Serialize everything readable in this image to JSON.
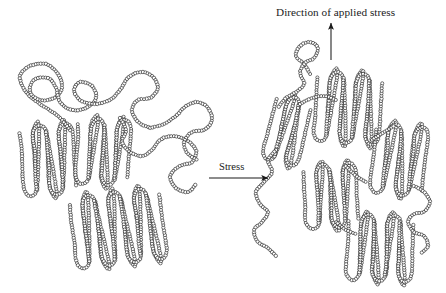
{
  "figure": {
    "width": 446,
    "height": 293,
    "background": "#ffffff",
    "ink_color": "#1b1b1b",
    "bead_fill": "#ffffff"
  },
  "labels": {
    "applied_stress_title": "Direction of applied stress",
    "stress_arrow_label": "Stress"
  },
  "arrows": {
    "vertical": {
      "name": "direction-of-applied-stress-arrow",
      "x": 331,
      "y_tail": 60,
      "y_head": 23,
      "points": "up"
    },
    "horizontal": {
      "name": "stress-transition-arrow",
      "y": 178,
      "x_tail": 209,
      "x_head": 268,
      "points": "right"
    }
  },
  "panels": [
    {
      "id": "undeformed",
      "name": "undeformed-polymer-structure",
      "description": "randomly oriented chain-folded lamellae with amorphous tie chains"
    },
    {
      "id": "deformed",
      "name": "deformed-polymer-structure",
      "description": "lamellae aligned along the stress axis with extended tie chains"
    }
  ],
  "chart_data": {
    "type": "diagram",
    "title": "Direction of applied stress",
    "annotations": [
      "Direction of applied stress",
      "Stress"
    ],
    "structures": {
      "undeformed": {
        "lamellae": [
          {
            "id": "L1",
            "cx": 48,
            "cy": 160,
            "angle": -4,
            "folds": 4,
            "fold_height": 56,
            "fold_pitch": 13
          },
          {
            "id": "L2",
            "cx": 103,
            "cy": 152,
            "angle": 3,
            "folds": 4,
            "fold_height": 52,
            "fold_pitch": 13
          },
          {
            "id": "L3",
            "cx": 118,
            "cy": 228,
            "angle": -7,
            "folds": 7,
            "fold_height": 58,
            "fold_pitch": 13
          }
        ],
        "amorphous_chains": [
          {
            "id": "A1",
            "region": "top-left coil"
          },
          {
            "id": "A2",
            "region": "central tie chain"
          },
          {
            "id": "A3",
            "region": "right trailing chain"
          }
        ]
      },
      "deformed": {
        "lamellae": [
          {
            "id": "R1",
            "cx": 287,
            "cy": 130,
            "angle": 14,
            "folds": 3,
            "fold_height": 54,
            "fold_pitch": 12
          },
          {
            "id": "R2",
            "cx": 348,
            "cy": 108,
            "angle": 4,
            "folds": 5,
            "fold_height": 56,
            "fold_pitch": 13
          },
          {
            "id": "R3",
            "cx": 399,
            "cy": 160,
            "angle": 6,
            "folds": 4,
            "fold_height": 56,
            "fold_pitch": 13
          },
          {
            "id": "R4",
            "cx": 331,
            "cy": 196,
            "angle": -3,
            "folds": 4,
            "fold_height": 50,
            "fold_pitch": 13
          },
          {
            "id": "R5",
            "cx": 380,
            "cy": 248,
            "angle": 2,
            "folds": 5,
            "fold_height": 52,
            "fold_pitch": 13
          }
        ],
        "amorphous_chains": [
          {
            "id": "B1",
            "region": "upper free chain end"
          },
          {
            "id": "B2",
            "region": "left extended tie chain"
          },
          {
            "id": "B3",
            "region": "right edge chain"
          }
        ]
      }
    }
  }
}
